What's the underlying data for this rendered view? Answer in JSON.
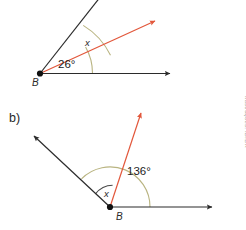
{
  "figure": {
    "background_color": "#ffffff",
    "credit": "Ilustrações: ID/BR",
    "colors": {
      "black_ray": "#2b2b2b",
      "red_ray": "#e2573b",
      "arc": "#b9b481",
      "arc_dark": "#4a4a4a",
      "label_text": "#1b1b1b",
      "credit_text": "#9a9a9a"
    }
  },
  "diagrams": [
    {
      "id": "diagram-a",
      "item_label": "",
      "vertex_label": "B",
      "known_angle": "26°",
      "unknown_angle": "x",
      "description": "Acute angle at vertex B with a horizontal ray to the right, a red ray above it, and a steep black ray; 26° between horizontal and red ray, x between red ray and steep black ray.",
      "rays": [
        {
          "name": "horizontal-right-ray",
          "color": "#2b2b2b",
          "arrow": true
        },
        {
          "name": "red-diagonal-ray",
          "color": "#e2573b",
          "arrow": true
        },
        {
          "name": "steep-black-ray",
          "color": "#2b2b2b",
          "arrow": false
        }
      ],
      "arcs": [
        {
          "name": "arc-26",
          "label": "26°",
          "color": "#b9b481"
        },
        {
          "name": "arc-x",
          "label": "x",
          "color": "#b9b481"
        }
      ]
    },
    {
      "id": "diagram-b",
      "item_label": "b)",
      "vertex_label": "B",
      "known_angle": "136°",
      "unknown_angle": "x",
      "description": "Obtuse angle at vertex B with a horizontal ray to the right, a red ray going up, and a black ray going up-left; 136° between horizontal and red ray, x between red ray and black up-left ray.",
      "rays": [
        {
          "name": "horizontal-right-ray",
          "color": "#2b2b2b",
          "arrow": true
        },
        {
          "name": "red-vertical-ray",
          "color": "#e2573b",
          "arrow": true
        },
        {
          "name": "black-upleft-ray",
          "color": "#2b2b2b",
          "arrow": true
        }
      ],
      "arcs": [
        {
          "name": "arc-136",
          "label": "136°",
          "color": "#b9b481"
        },
        {
          "name": "arc-x",
          "label": "x",
          "color": "#4a4a4a"
        }
      ]
    }
  ]
}
